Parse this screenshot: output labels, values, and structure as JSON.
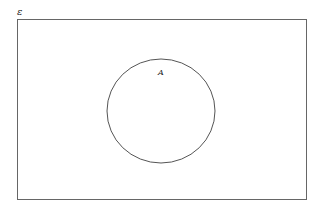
{
  "diagram": {
    "type": "venn",
    "universal_set": {
      "label": "ε",
      "rect": {
        "x": 17,
        "y": 19,
        "width": 289,
        "height": 180
      }
    },
    "sets": [
      {
        "label": "A",
        "cx": 161,
        "cy": 111,
        "rx": 54,
        "ry": 52
      }
    ],
    "stroke_color": "#555555",
    "background": "#ffffff"
  }
}
